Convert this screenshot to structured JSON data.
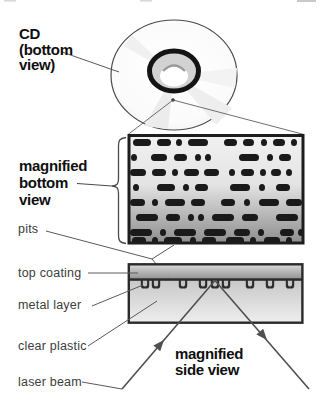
{
  "figure": {
    "labels": {
      "cd": [
        "CD",
        "(bottom",
        "view)"
      ],
      "magnified_bottom": [
        "magnified",
        "bottom",
        "view"
      ],
      "pits": "pits",
      "top_coating": "top coating",
      "metal_layer": "metal layer",
      "clear_plastic": "clear plastic",
      "laser_beam": "laser beam",
      "magnified_side": [
        "magnified",
        "side view"
      ]
    },
    "colors": {
      "pit": "#1a1a1a",
      "metal": "#2c2c2c",
      "bump_inner": "#c4c4c4",
      "outline": "#222222",
      "hub_ring": "#141414",
      "hub_fill": "#d2d2d2",
      "pointer_line": "#5a5a5a",
      "beam_line": "#4f4f4f",
      "label_bold": "#0f0f0f",
      "label_light": "#3d3d3d"
    },
    "bottom_view_pits": {
      "rows": [
        {
          "y": 139,
          "x": 133,
          "seg": [
            18,
            6,
            14,
            5,
            6,
            6,
            20,
            16,
            13,
            6,
            11,
            7,
            6,
            6,
            12,
            6,
            6
          ]
        },
        {
          "y": 154,
          "x": 131,
          "seg": [
            6,
            14,
            16,
            7,
            13,
            8,
            6,
            4,
            6,
            28,
            20,
            8,
            6,
            6,
            12
          ]
        },
        {
          "y": 169,
          "x": 130,
          "seg": [
            16,
            6,
            14,
            6,
            6,
            6,
            15,
            5,
            15,
            10,
            6,
            6,
            13,
            6,
            6,
            5,
            10,
            5,
            6
          ]
        },
        {
          "y": 184,
          "x": 133,
          "seg": [
            6,
            18,
            18,
            8,
            6,
            6,
            13,
            22,
            20,
            9,
            6,
            11,
            14
          ]
        },
        {
          "y": 199,
          "x": 130,
          "seg": [
            15,
            7,
            6,
            7,
            20,
            6,
            14,
            16,
            14,
            9,
            6,
            9,
            20,
            7,
            16
          ]
        },
        {
          "y": 214,
          "x": 136,
          "seg": [
            22,
            8,
            14,
            8,
            6,
            4,
            6,
            8,
            22,
            8,
            16,
            18,
            22
          ]
        },
        {
          "y": 229,
          "x": 130,
          "seg": [
            22,
            8,
            6,
            8,
            22,
            8,
            22,
            8,
            16,
            8,
            6,
            16,
            14,
            4,
            6
          ]
        },
        {
          "y": 237,
          "x": 132,
          "seg": [
            14,
            6,
            6,
            6,
            18,
            8,
            6,
            6,
            14,
            10,
            18,
            6,
            6,
            8,
            16,
            6,
            6
          ]
        }
      ]
    },
    "side_view_pit_centers": [
      145,
      156,
      183,
      203,
      215,
      226,
      250,
      270,
      290
    ]
  }
}
